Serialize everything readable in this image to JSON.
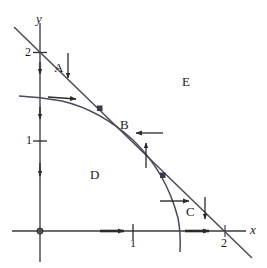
{
  "figure": {
    "axes": {
      "x_label": "x",
      "y_label": "y",
      "x_ticks": [
        {
          "value": "1",
          "px": 133
        },
        {
          "value": "2",
          "px": 225
        }
      ],
      "y_ticks": [
        {
          "value": "1",
          "px": 141
        },
        {
          "value": "2",
          "px": 53
        }
      ],
      "origin": {
        "x": 40,
        "y": 231
      },
      "unit_px": 93
    },
    "regions": [
      {
        "label": "A",
        "x": 58,
        "y": 66
      },
      {
        "label": "B",
        "x": 123,
        "y": 123
      },
      {
        "label": "C",
        "x": 189,
        "y": 210
      },
      {
        "label": "D",
        "x": 93,
        "y": 173
      },
      {
        "label": "E",
        "x": 185,
        "y": 79
      }
    ],
    "curves": {
      "line_label": "straight line through (0,2) and (2,0)",
      "arc_label": "circular arc of radius 1.5 centered at origin"
    },
    "intersections": [
      {
        "x": 100,
        "y": 108
      },
      {
        "x": 163,
        "y": 175
      }
    ],
    "arrow_count": 11,
    "colors": {
      "ink": "#2b2b2b",
      "background": "#ffffff"
    }
  }
}
